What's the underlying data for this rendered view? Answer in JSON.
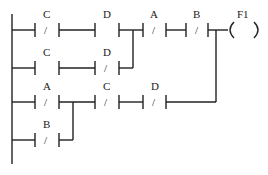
{
  "diagram": {
    "type": "ladder-logic",
    "rungs": [
      {
        "id": 1,
        "contacts": [
          {
            "label": "C",
            "type": "normally-closed"
          },
          {
            "label": "D",
            "type": "normally-open"
          },
          {
            "label": "A",
            "type": "normally-closed"
          },
          {
            "label": "B",
            "type": "normally-closed"
          }
        ],
        "coil": {
          "label": "F1"
        }
      },
      {
        "id": 2,
        "contacts": [
          {
            "label": "C",
            "type": "normally-open"
          },
          {
            "label": "D",
            "type": "normally-closed"
          }
        ],
        "parallel_to": "rung-1 C-D segment"
      },
      {
        "id": 3,
        "contacts": [
          {
            "label": "A",
            "type": "normally-closed"
          },
          {
            "label": "C",
            "type": "normally-closed"
          },
          {
            "label": "D",
            "type": "normally-closed"
          }
        ],
        "joins": "coil F1"
      },
      {
        "id": 4,
        "contacts": [
          {
            "label": "B",
            "type": "normally-closed"
          }
        ],
        "parallel_to": "rung-3 A contact"
      }
    ]
  },
  "labels": {
    "r1c1": "C",
    "r1c2": "D",
    "r1c3": "A",
    "r1c4": "B",
    "coil": "F1",
    "r2c1": "C",
    "r2c2": "D",
    "r3c1": "A",
    "r3c2": "C",
    "r3c3": "D",
    "r4c1": "B",
    "slash": "/"
  }
}
